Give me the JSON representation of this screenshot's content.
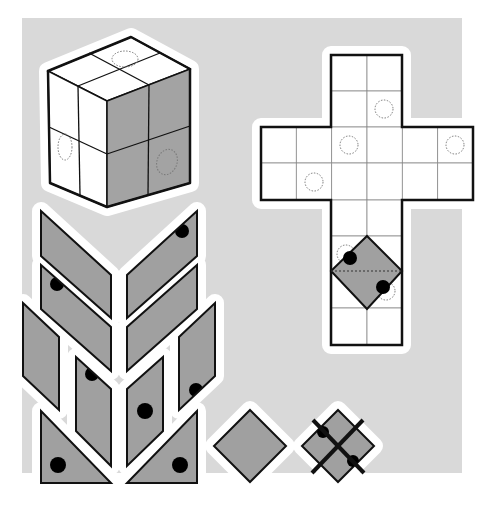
{
  "colors": {
    "page_bg": "#ffffff",
    "panel_bg": "#d9d9d9",
    "halo": "#ffffff",
    "face_white": "#ffffff",
    "face_gray": "#a3a3a3",
    "piece_fill": "#a0a0a0",
    "stroke": "#111111",
    "grid": "#8a8a8a",
    "dot": "#000000",
    "dotted": "#777777"
  },
  "panel": {
    "x": 22,
    "y": 18,
    "w": 440,
    "h": 455
  },
  "cube": {
    "top_face": [
      [
        131,
        37
      ],
      [
        190,
        69
      ],
      [
        107,
        101
      ],
      [
        48,
        71
      ]
    ],
    "left_face": [
      [
        48,
        71
      ],
      [
        107,
        101
      ],
      [
        107,
        207
      ],
      [
        50,
        183
      ]
    ],
    "right_face": [
      [
        107,
        101
      ],
      [
        190,
        69
      ],
      [
        190,
        183
      ],
      [
        107,
        207
      ]
    ],
    "grid_lines": [
      [
        [
          89,
          53
        ],
        [
          149,
          85
        ]
      ],
      [
        [
          160,
          53
        ],
        [
          78,
          86
        ]
      ],
      [
        [
          78,
          86
        ],
        [
          80,
          195
        ]
      ],
      [
        [
          49,
          127
        ],
        [
          107,
          154
        ]
      ],
      [
        [
          149,
          85
        ],
        [
          148,
          195
        ]
      ],
      [
        [
          107,
          154
        ],
        [
          190,
          126
        ]
      ]
    ],
    "dotted_ellipses": [
      {
        "cx": 125,
        "cy": 59,
        "rx": 13,
        "ry": 8,
        "rot": 0
      },
      {
        "cx": 65,
        "cy": 147,
        "rx": 7,
        "ry": 13,
        "rot": 0
      },
      {
        "cx": 167,
        "cy": 162,
        "rx": 10,
        "ry": 13,
        "rot": 20
      }
    ]
  },
  "net": {
    "cell": 35.5,
    "origin_x": 261,
    "origin_y": 55,
    "cells": [
      [
        2,
        0
      ],
      [
        3,
        0
      ],
      [
        2,
        1
      ],
      [
        3,
        1
      ],
      [
        0,
        2
      ],
      [
        1,
        2
      ],
      [
        2,
        2
      ],
      [
        3,
        2
      ],
      [
        4,
        2
      ],
      [
        5,
        2
      ],
      [
        0,
        3
      ],
      [
        1,
        3
      ],
      [
        2,
        3
      ],
      [
        3,
        3
      ],
      [
        4,
        3
      ],
      [
        5,
        3
      ],
      [
        2,
        4
      ],
      [
        3,
        4
      ],
      [
        2,
        5
      ],
      [
        3,
        5
      ],
      [
        2,
        6
      ],
      [
        3,
        6
      ],
      [
        2,
        7
      ],
      [
        3,
        7
      ]
    ],
    "outline": [
      [
        331,
        55
      ],
      [
        402,
        55
      ],
      [
        402,
        127
      ],
      [
        473,
        127
      ],
      [
        473,
        200
      ],
      [
        402,
        200
      ],
      [
        402,
        345
      ],
      [
        331,
        345
      ],
      [
        331,
        200
      ],
      [
        261,
        200
      ],
      [
        261,
        127
      ],
      [
        331,
        127
      ]
    ],
    "dotted_circles": [
      {
        "cx": 384,
        "cy": 109
      },
      {
        "cx": 349,
        "cy": 145
      },
      {
        "cx": 455,
        "cy": 145
      },
      {
        "cx": 314,
        "cy": 182
      }
    ],
    "overlay_diamond": {
      "points": [
        [
          367,
          236
        ],
        [
          402,
          271
        ],
        [
          367,
          309
        ],
        [
          331,
          271
        ]
      ],
      "dashed_diagonal": [
        [
          331,
          271
        ],
        [
          402,
          271
        ]
      ],
      "dots": [
        {
          "cx": 350,
          "cy": 258,
          "r": 7
        },
        {
          "cx": 383,
          "cy": 287,
          "r": 7
        }
      ],
      "dotted_circles": [
        {
          "cx": 346,
          "cy": 254
        },
        {
          "cx": 386,
          "cy": 291
        }
      ]
    }
  },
  "pieces": [
    {
      "name": "parallelogram-left-1",
      "points": [
        [
          41,
          211
        ],
        [
          111,
          275
        ],
        [
          111,
          318
        ],
        [
          41,
          256
        ]
      ],
      "dot": null
    },
    {
      "name": "parallelogram-right-1",
      "points": [
        [
          197,
          211
        ],
        [
          197,
          256
        ],
        [
          127,
          318
        ],
        [
          127,
          275
        ]
      ],
      "dot": {
        "cx": 182,
        "cy": 231,
        "r": 7
      }
    },
    {
      "name": "parallelogram-left-2",
      "points": [
        [
          41,
          265
        ],
        [
          111,
          327
        ],
        [
          111,
          371
        ],
        [
          41,
          309
        ]
      ],
      "dot": {
        "cx": 57,
        "cy": 284,
        "r": 7
      }
    },
    {
      "name": "parallelogram-right-2",
      "points": [
        [
          197,
          265
        ],
        [
          197,
          309
        ],
        [
          127,
          371
        ],
        [
          127,
          327
        ]
      ],
      "dot": null
    },
    {
      "name": "rhomb-left-outer",
      "points": [
        [
          23,
          303
        ],
        [
          59,
          337
        ],
        [
          59,
          410
        ],
        [
          23,
          376
        ]
      ],
      "dot": null
    },
    {
      "name": "rhomb-right-outer",
      "points": [
        [
          215,
          303
        ],
        [
          215,
          376
        ],
        [
          179,
          410
        ],
        [
          179,
          337
        ]
      ],
      "dot": {
        "cx": 196,
        "cy": 390,
        "r": 7
      }
    },
    {
      "name": "rhomb-left-inner",
      "points": [
        [
          76,
          357
        ],
        [
          111,
          389
        ],
        [
          111,
          466
        ],
        [
          76,
          431
        ]
      ],
      "dot": {
        "cx": 92,
        "cy": 374,
        "r": 7
      }
    },
    {
      "name": "rhomb-right-inner",
      "points": [
        [
          163,
          357
        ],
        [
          163,
          431
        ],
        [
          127,
          466
        ],
        [
          127,
          389
        ]
      ],
      "dot": {
        "cx": 145,
        "cy": 411,
        "r": 8
      }
    },
    {
      "name": "triangle-left",
      "points": [
        [
          41,
          411
        ],
        [
          111,
          483
        ],
        [
          41,
          483
        ]
      ],
      "dot": {
        "cx": 58,
        "cy": 465,
        "r": 8
      }
    },
    {
      "name": "triangle-right",
      "points": [
        [
          197,
          411
        ],
        [
          197,
          483
        ],
        [
          127,
          483
        ]
      ],
      "dot": {
        "cx": 180,
        "cy": 465,
        "r": 8
      }
    }
  ],
  "loose_diamond": {
    "points": [
      [
        250,
        410
      ],
      [
        286,
        446
      ],
      [
        250,
        482
      ],
      [
        214,
        446
      ]
    ]
  },
  "crossed_diamond": {
    "points": [
      [
        338,
        410
      ],
      [
        374,
        446
      ],
      [
        338,
        482
      ],
      [
        302,
        446
      ]
    ],
    "lines": [
      [
        [
          313,
          420
        ],
        [
          364,
          473
        ]
      ],
      [
        [
          363,
          420
        ],
        [
          312,
          473
        ]
      ]
    ],
    "dots": [
      {
        "cx": 323,
        "cy": 432,
        "r": 6
      },
      {
        "cx": 353,
        "cy": 461,
        "r": 6
      }
    ]
  }
}
